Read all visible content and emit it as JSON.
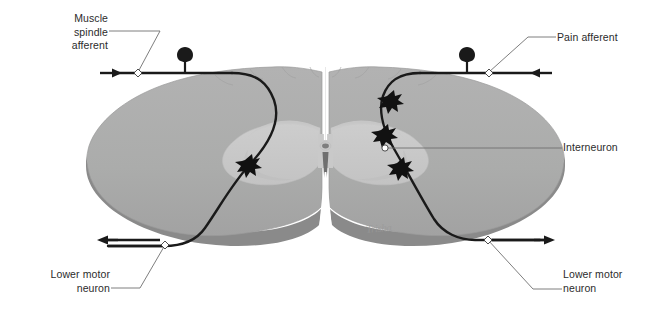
{
  "figure": {
    "signature": "Trisha",
    "background_color": "#ffffff"
  },
  "colors": {
    "white_matter": "#ababab",
    "gray_matter": "#c9c9c9",
    "edge_shadow": "#8a8a8a",
    "outline": "#9b9b9b",
    "neuron_stroke": "#1a1a1a",
    "leader_line": "#6f6f6f",
    "label_text": "#2b2b2b",
    "signature": "#9a9a9a",
    "canal": "#7e7e7e"
  },
  "labels": [
    {
      "id": "muscle-spindle-afferent",
      "text": "Muscle\nspindle\nafferent",
      "align": "right",
      "side": "top-left"
    },
    {
      "id": "pain-afferent",
      "text": "Pain afferent",
      "align": "left",
      "side": "top-right"
    },
    {
      "id": "interneuron",
      "text": "Interneuron",
      "align": "left",
      "side": "middle-right"
    },
    {
      "id": "lower-motor-neuron-left",
      "text": "Lower motor\nneuron",
      "align": "right",
      "side": "bottom-left"
    },
    {
      "id": "lower-motor-neuron-right",
      "text": "Lower motor\nneuron",
      "align": "left",
      "side": "bottom-right"
    }
  ],
  "anatomy": {
    "structures": [
      "white-matter",
      "gray-matter-butterfly",
      "central-canal",
      "anterior-median-fissure",
      "posterior-median-sulcus",
      "cut-edge-shadow"
    ]
  },
  "pathways": {
    "sensory_left": {
      "name": "muscle-spindle-afferent-fiber",
      "direction_arrow": "right",
      "ganglion": "dorsal-root-ganglion-left",
      "synapse_count": 1
    },
    "sensory_right": {
      "name": "pain-afferent-fiber",
      "direction_arrow": "left",
      "ganglion": "dorsal-root-ganglion-right",
      "synapse_count": 3
    },
    "motor_left": {
      "name": "lower-motor-neuron-axon-left",
      "direction_arrow": "left"
    },
    "motor_right": {
      "name": "lower-motor-neuron-axon-right",
      "direction_arrow": "right"
    }
  }
}
